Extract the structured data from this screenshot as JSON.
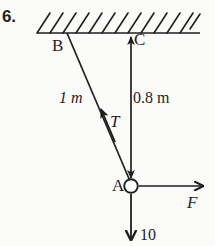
{
  "figure": {
    "item_number": "6.",
    "points": {
      "b": "B",
      "c": "C",
      "a": "A"
    },
    "dimensions": {
      "cable_ba_length": "1 m",
      "rod_ca_length": "0.8 m"
    },
    "forces": {
      "tension": "T",
      "applied": "F",
      "weight": "10"
    },
    "colors": {
      "ink": "#1f1f1f",
      "background": "#fbfbfa",
      "joint_fill": "#ffffff"
    },
    "geometry": {
      "ceiling_y": 33,
      "ceiling_x_start": 37,
      "ceiling_x_end": 200,
      "hatch_count": 12,
      "point_b": [
        67,
        33
      ],
      "point_c": [
        131,
        33
      ],
      "point_a": [
        131,
        186
      ],
      "joint_radius": 7,
      "force_arrow_end_x": 205,
      "weight_arrow_end_y": 243
    }
  }
}
